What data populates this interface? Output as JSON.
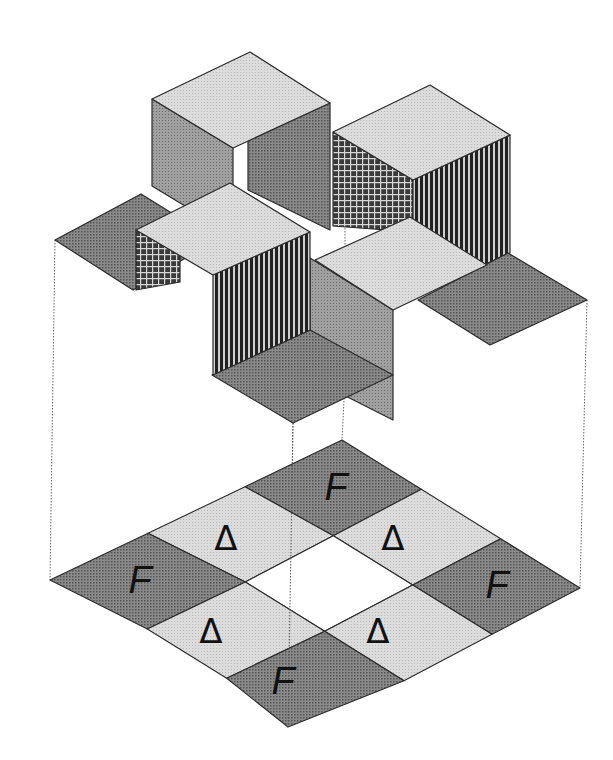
{
  "figure": {
    "type": "isometric-tile-diagram",
    "colors": {
      "light": "#d6d6d6",
      "mid": "#9a9a9a",
      "dark": "#7a7a7a",
      "outline": "#2a2a2a",
      "background": "#ffffff",
      "projection_line": "#666666"
    },
    "upper_structure": {
      "description": "3D stacked cubes above an isometric grid",
      "cubes": [
        {
          "name": "cube-back-left"
        },
        {
          "name": "cube-back-right"
        },
        {
          "name": "cube-front-left"
        },
        {
          "name": "cube-front-right"
        }
      ],
      "flat_tiles": [
        {
          "name": "tile-left"
        },
        {
          "name": "tile-right"
        },
        {
          "name": "tile-bottom"
        }
      ]
    },
    "bottom_grid": {
      "description": "3x3 isometric grid with empty center",
      "cells": [
        {
          "position": "top",
          "label": "F",
          "shade": "dark"
        },
        {
          "position": "upper-left",
          "label": "Δ",
          "shade": "light"
        },
        {
          "position": "upper-right",
          "label": "Δ",
          "shade": "light"
        },
        {
          "position": "left",
          "label": "F",
          "shade": "dark"
        },
        {
          "position": "center",
          "label": "",
          "shade": "empty"
        },
        {
          "position": "right",
          "label": "F",
          "shade": "dark"
        },
        {
          "position": "lower-left",
          "label": "Δ",
          "shade": "light"
        },
        {
          "position": "lower-right",
          "label": "Δ",
          "shade": "light"
        },
        {
          "position": "bottom",
          "label": "F",
          "shade": "dark"
        }
      ]
    }
  }
}
